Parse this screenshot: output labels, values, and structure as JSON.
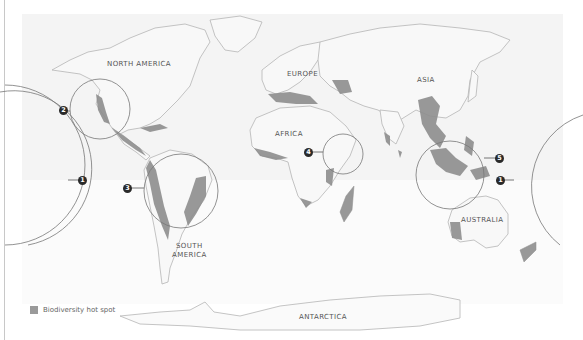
{
  "map": {
    "type": "world map",
    "colors": {
      "ocean_panel": "#f3f3f3",
      "land": "#f7f7f7",
      "land_outline": "#b8b8b8",
      "hotspot": "#8e8e8e",
      "circle_stroke": "#777777",
      "marker_fill": "#2a2a2a"
    },
    "regions": [
      {
        "id": "north-america",
        "label": "NORTH AMERICA"
      },
      {
        "id": "south-america",
        "label_line1": "SOUTH",
        "label_line2": "AMERICA"
      },
      {
        "id": "europe",
        "label": "EUROPE"
      },
      {
        "id": "africa",
        "label": "AFRICA"
      },
      {
        "id": "asia",
        "label": "ASIA"
      },
      {
        "id": "australia",
        "label": "AUSTRALIA"
      },
      {
        "id": "antarctica",
        "label": "ANTARCTICA"
      }
    ],
    "callouts": [
      {
        "number": "1",
        "region": "Pacific (left edge circle)"
      },
      {
        "number": "2",
        "region": "California / Mexico"
      },
      {
        "number": "3",
        "region": "Andes / Amazon / Atlantic Forest"
      },
      {
        "number": "4",
        "region": "Horn of Africa / Ethiopia"
      },
      {
        "number": "5",
        "region": "Southeast Asia / Indonesia"
      },
      {
        "number": "1",
        "region": "Pacific (right edge circle)"
      }
    ]
  },
  "legend": {
    "label": "Biodiversity hot spot"
  }
}
